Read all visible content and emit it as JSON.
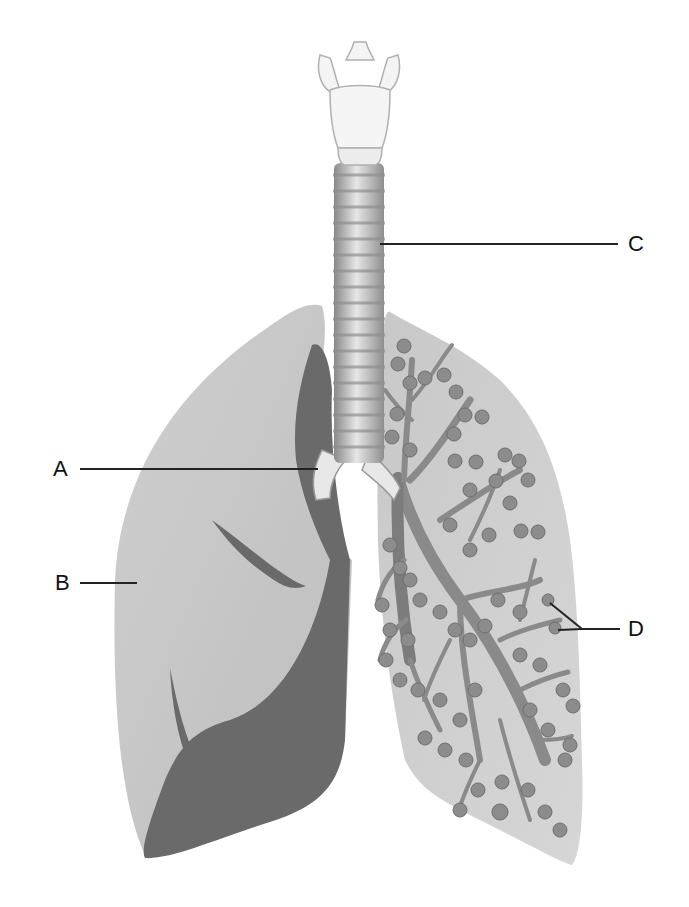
{
  "diagram": {
    "labels": [
      {
        "id": "A",
        "text": "A",
        "points_to": "bronchus (main bronchus branching from trachea)"
      },
      {
        "id": "B",
        "text": "B",
        "points_to": "lung (right lung, outer surface)"
      },
      {
        "id": "C",
        "text": "C",
        "points_to": "trachea"
      },
      {
        "id": "D",
        "text": "D",
        "points_to": "alveoli (air sacs at bronchiole ends)"
      }
    ],
    "colors": {
      "background": "#ffffff",
      "lung_light": "#c4c4c4",
      "lung_dark": "#6a6a6a",
      "trachea": "#b8b8b8",
      "trachea_ring": "#8e8e8e",
      "larynx": "#f2f2f2",
      "bronchiole": "#8a8a8a",
      "alveoli": "#8c8c8c",
      "leader_line": "#222222",
      "label_text": "#111111"
    }
  }
}
